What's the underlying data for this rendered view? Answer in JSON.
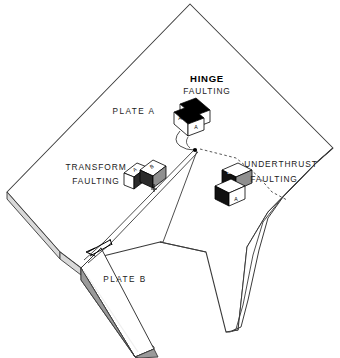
{
  "figure": {
    "background_color": "#ffffff",
    "line_color": "#3a3a3a",
    "fill_white": "#ffffff",
    "fill_black": "#000000",
    "fill_gray": "#9a9a9a",
    "fill_light_gray": "#c8c8c8"
  },
  "labels": {
    "hinge_title": "HINGE",
    "hinge_sub": "FAULTING",
    "transform_title": "TRANSFORM",
    "transform_sub": "FAULTING",
    "underthrust_title": "UNDERTHRUST",
    "underthrust_sub": "FAULTING",
    "plate_a": "PLATE  A",
    "plate_b": "PLATE  B"
  },
  "blocks": {
    "hinge": {
      "name": "hinge-faulting-block",
      "parts": [
        "A",
        "A"
      ],
      "left_label": "A",
      "right_label": "A"
    },
    "transform": {
      "name": "transform-faulting-block",
      "left_label": "A",
      "right_label": "B"
    },
    "underthrust": {
      "name": "underthrust-faulting-block",
      "upper_label": "B",
      "lower_label": "A"
    }
  },
  "annotations": {
    "transform_arrow": "relative-motion-arrow",
    "ridge": "spreading-ridge-zigzag",
    "trench": "subduction-trench-curve",
    "leader_hinge": "hinge-leader-line",
    "leader_underthrust": "underthrust-leader-dashed",
    "leader_transform": "transform-leader-line"
  }
}
